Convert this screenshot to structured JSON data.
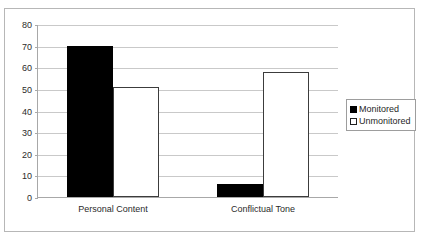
{
  "chart_data": {
    "type": "bar",
    "title": "",
    "xlabel": "",
    "ylabel": "",
    "ylim": [
      0,
      80
    ],
    "yticks": [
      0,
      10,
      20,
      30,
      40,
      50,
      60,
      70,
      80
    ],
    "ytick_labels": [
      "0",
      "10",
      "20",
      "30",
      "40",
      "50",
      "60",
      "70",
      "80"
    ],
    "grid": true,
    "legend_position": "right",
    "categories": [
      "Personal Content",
      "Conflictual Tone"
    ],
    "series": [
      {
        "name": "Monitored",
        "color": "#000000",
        "values": [
          70,
          6
        ]
      },
      {
        "name": "Unmonitored",
        "color": "#ffffff",
        "values": [
          51,
          58
        ]
      }
    ]
  },
  "legend": {
    "items": [
      {
        "label": "Monitored",
        "style": "filled"
      },
      {
        "label": "Unmonitored",
        "style": "hollow"
      }
    ]
  }
}
